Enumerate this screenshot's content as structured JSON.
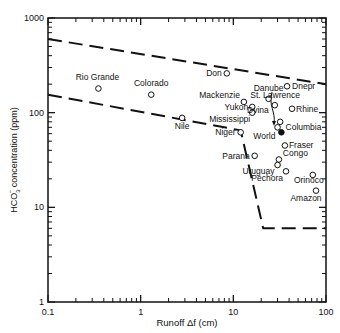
{
  "chart_data": {
    "type": "scatter",
    "title": "",
    "xlabel": "Runoff Δf (cm)",
    "ylabel": "HCO3⁻ concentration (ppm)",
    "xscale": "log",
    "yscale": "log",
    "xlim": [
      0.1,
      100
    ],
    "ylim": [
      1,
      1000
    ],
    "grid": false,
    "x_ticks": [
      "0.1",
      "1",
      "10",
      "100"
    ],
    "y_ticks": [
      "1",
      "10",
      "100",
      "1000"
    ],
    "points": [
      {
        "name": "Rio Grande",
        "x": 0.35,
        "y": 180,
        "filled": false
      },
      {
        "name": "Colorado",
        "x": 1.3,
        "y": 155,
        "filled": false
      },
      {
        "name": "Nile",
        "x": 2.8,
        "y": 88,
        "filled": false
      },
      {
        "name": "Don",
        "x": 8.5,
        "y": 260,
        "filled": false
      },
      {
        "name": "Dnepr",
        "x": 38,
        "y": 190,
        "filled": false
      },
      {
        "name": "Danube",
        "x": 24,
        "y": 140,
        "filled": false
      },
      {
        "name": "Mackenzie",
        "x": 13,
        "y": 130,
        "filled": false
      },
      {
        "name": "Yukon",
        "x": 16,
        "y": 115,
        "filled": false
      },
      {
        "name": "Mississippi",
        "x": 16,
        "y": 100,
        "filled": false
      },
      {
        "name": "Dvina",
        "x": 28,
        "y": 120,
        "filled": false
      },
      {
        "name": "Rhine",
        "x": 43,
        "y": 110,
        "filled": false
      },
      {
        "name": "St. Lawrence",
        "x": 32,
        "y": 80,
        "filled": false
      },
      {
        "name": "Columbia",
        "x": 30,
        "y": 70,
        "filled": false
      },
      {
        "name": "World",
        "x": 33,
        "y": 62,
        "filled": true
      },
      {
        "name": "Niger",
        "x": 12,
        "y": 62,
        "filled": false
      },
      {
        "name": "Fraser",
        "x": 36,
        "y": 45,
        "filled": false
      },
      {
        "name": "Parana",
        "x": 17,
        "y": 35,
        "filled": false
      },
      {
        "name": "Congo",
        "x": 31,
        "y": 32,
        "filled": false
      },
      {
        "name": "Uruguay",
        "x": 30,
        "y": 28,
        "filled": false
      },
      {
        "name": "Pechora",
        "x": 37,
        "y": 24,
        "filled": false
      },
      {
        "name": "Orinoco",
        "x": 72,
        "y": 22,
        "filled": false
      },
      {
        "name": "Amazon",
        "x": 78,
        "y": 15,
        "filled": false
      }
    ],
    "boundary_lines": [
      {
        "name": "upper-bound",
        "style": "dashed",
        "points": [
          [
            0.1,
            600
          ],
          [
            100,
            200
          ]
        ]
      },
      {
        "name": "lower-bound",
        "style": "dashed",
        "points": [
          [
            0.1,
            155
          ],
          [
            12,
            65
          ],
          [
            21,
            6
          ],
          [
            100,
            6
          ]
        ]
      }
    ]
  },
  "labels": {
    "x_axis": "Runoff Δf (cm)",
    "y_axis_prefix": "HCO",
    "y_axis_sub": "3",
    "y_axis_sup": "−",
    "y_axis_suffix": " concentration (ppm)",
    "x_ticks": [
      "0.1",
      "1",
      "10",
      "100"
    ],
    "y_ticks": [
      "1",
      "10",
      "100",
      "1000"
    ]
  }
}
